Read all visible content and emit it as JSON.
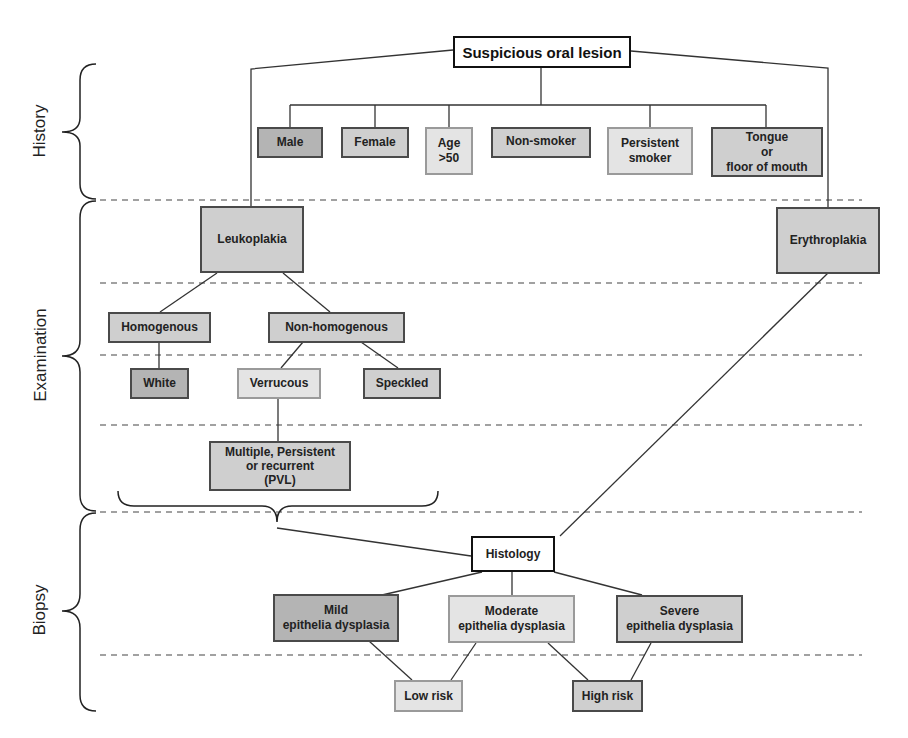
{
  "diagram": {
    "title": "Suspicious oral lesion",
    "stages": [
      {
        "id": "history",
        "label": "History"
      },
      {
        "id": "examination",
        "label": "Examination"
      },
      {
        "id": "biopsy",
        "label": "Biopsy"
      }
    ],
    "colors": {
      "dark_fill": "#b4b4b4",
      "mid_fill": "#cfcfcf",
      "light_fill": "#e4e4e4",
      "white_fill": "#ffffff",
      "line": "#333333"
    },
    "history_factors": [
      {
        "id": "male",
        "label": "Male",
        "shade": "dark"
      },
      {
        "id": "female",
        "label": "Female",
        "shade": "mid"
      },
      {
        "id": "age",
        "label": "Age\n>50",
        "shade": "light"
      },
      {
        "id": "non_smoker",
        "label": "Non-smoker",
        "shade": "mid"
      },
      {
        "id": "persistent_smoker",
        "label": "Persistent\nsmoker",
        "shade": "light"
      },
      {
        "id": "tongue",
        "label": "Tongue\nor\nfloor of mouth",
        "shade": "mid"
      }
    ],
    "examination": {
      "leukoplakia": "Leukoplakia",
      "erythroplakia": "Erythroplakia",
      "homogenous": "Homogenous",
      "non_homogenous": "Non-homogenous",
      "white": "White",
      "verrucous": "Verrucous",
      "speckled": "Speckled",
      "pvl": "Multiple, Persistent\nor recurrent\n(PVL)"
    },
    "biopsy": {
      "histology": "Histology",
      "mild": "Mild\nepithelia dysplasia",
      "moderate": "Moderate\nepithelia dysplasia",
      "severe": "Severe\nepithelia dysplasia",
      "low_risk": "Low risk",
      "high_risk": "High risk"
    }
  }
}
